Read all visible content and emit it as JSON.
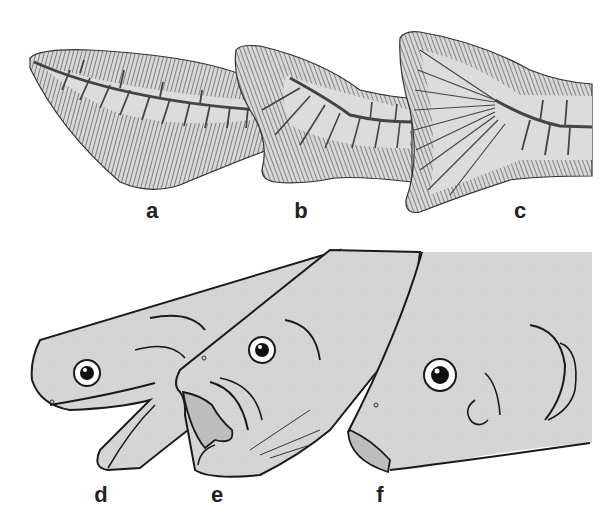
{
  "figure": {
    "colors": {
      "background": "#ffffff",
      "fill": "#d8d8d8",
      "fill_dark": "#bdbdbd",
      "hatch": "#555555",
      "outline": "#1a1a1a",
      "spine": "#444444"
    },
    "tails": [
      {
        "label": "a",
        "type": "heterocercal-primitive"
      },
      {
        "label": "b",
        "type": "intermediate"
      },
      {
        "label": "c",
        "type": "homocercal"
      }
    ],
    "heads": [
      {
        "label": "d",
        "type": "elongated-jaw"
      },
      {
        "label": "e",
        "type": "open-mouth"
      },
      {
        "label": "f",
        "type": "protrusible-mouth"
      }
    ]
  }
}
